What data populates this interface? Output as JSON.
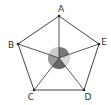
{
  "diagram": {
    "type": "pentagon-with-center",
    "vertices": [
      {
        "label": "A",
        "x": 59,
        "y": 16,
        "label_x": 61,
        "label_y": 12
      },
      {
        "label": "B",
        "x": 18,
        "y": 44,
        "label_x": 11,
        "label_y": 48
      },
      {
        "label": "C",
        "x": 34,
        "y": 90,
        "label_x": 31,
        "label_y": 100
      },
      {
        "label": "D",
        "x": 84,
        "y": 90,
        "label_x": 88,
        "label_y": 100
      },
      {
        "label": "E",
        "x": 99,
        "y": 44,
        "label_x": 104,
        "label_y": 45
      }
    ],
    "center": {
      "x": 59,
      "y": 58,
      "radius": 11
    },
    "sectors": [
      {
        "from": "A",
        "to": "E",
        "color": "#777777"
      },
      {
        "from": "E",
        "to": "D",
        "color": "#d8d8d8"
      },
      {
        "from": "D",
        "to": "C",
        "color": "#666666"
      },
      {
        "from": "C",
        "to": "B",
        "color": "#999999"
      },
      {
        "from": "B",
        "to": "A",
        "color": "#cccccc"
      }
    ],
    "stroke_color": "#444444"
  }
}
